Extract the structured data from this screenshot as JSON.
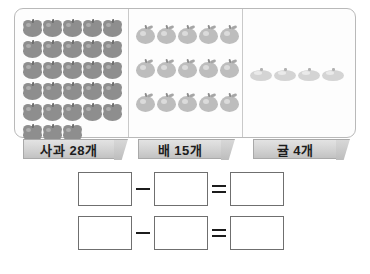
{
  "worksheet": {
    "panel": {
      "columns": [
        {
          "key": "apples",
          "fruit_icon": "apple-icon",
          "label": "사과 28개",
          "count": 28,
          "rows": [
            5,
            5,
            5,
            5,
            5,
            3
          ]
        },
        {
          "key": "pears",
          "fruit_icon": "pear-icon",
          "label": "배 15개",
          "count": 15,
          "rows": [
            5,
            5,
            5
          ]
        },
        {
          "key": "tangerines",
          "fruit_icon": "tangerine-icon",
          "label": "귤 4개",
          "count": 4,
          "rows": [
            4
          ]
        }
      ]
    },
    "equations": [
      {
        "operand_a": "",
        "operator": "−",
        "operand_b": "",
        "equals": "=",
        "result": ""
      },
      {
        "operand_a": "",
        "operator": "−",
        "operand_b": "",
        "equals": "=",
        "result": ""
      }
    ],
    "colors": {
      "panel_border": "#b9b9b9",
      "divider": "#c9c9c9",
      "apple_fill": "#8e8e8e",
      "pear_fill": "#bdbdbd",
      "tangerine_fill": "#d4d4d4",
      "ribbon_fill": "#d2d2d2",
      "ribbon_border": "#a9a9a9",
      "box_border": "#6f6f6f",
      "text": "#1c1c1c",
      "background": "#ffffff"
    }
  }
}
